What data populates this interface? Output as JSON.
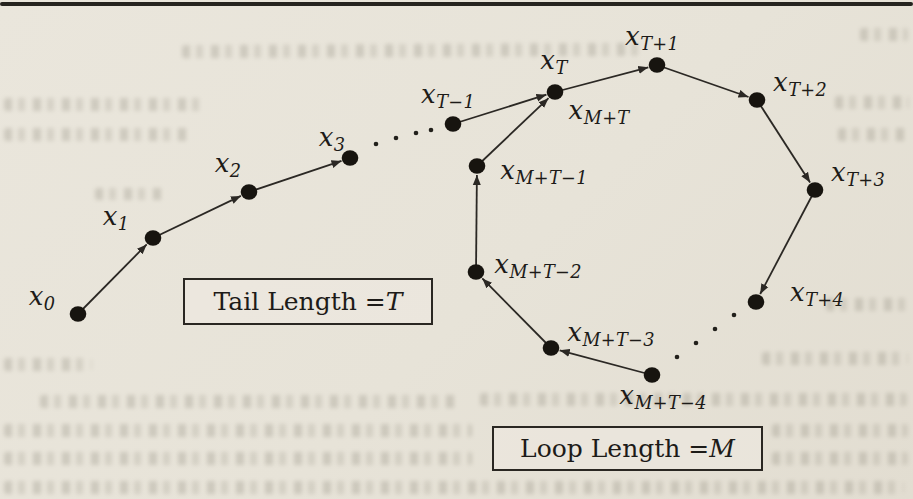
{
  "labels": {
    "x0": {
      "base": "x",
      "sub": "0"
    },
    "x1": {
      "base": "x",
      "sub": "1"
    },
    "x2": {
      "base": "x",
      "sub": "2"
    },
    "x3": {
      "base": "x",
      "sub": "3"
    },
    "xTm1": {
      "base": "x",
      "sub": "T−1"
    },
    "xT": {
      "base": "x",
      "sub": "T"
    },
    "xMpT": {
      "base": "x",
      "sub": "M+T"
    },
    "xTp1": {
      "base": "x",
      "sub": "T+1"
    },
    "xTp2": {
      "base": "x",
      "sub": "T+2"
    },
    "xTp3": {
      "base": "x",
      "sub": "T+3"
    },
    "xTp4": {
      "base": "x",
      "sub": "T+4"
    },
    "xMpTm1": {
      "base": "x",
      "sub": "M+T−1"
    },
    "xMpTm2": {
      "base": "x",
      "sub": "M+T−2"
    },
    "xMpTm3": {
      "base": "x",
      "sub": "M+T−3"
    },
    "xMpTm4": {
      "base": "x",
      "sub": "M+T−4"
    }
  },
  "boxes": {
    "tail": {
      "prefix": "Tail Length = ",
      "symbol": "T"
    },
    "loop": {
      "prefix": "Loop Length = ",
      "symbol": "M"
    }
  },
  "colors": {
    "paper": "#e8e4d9",
    "ink": "#1d1b18",
    "dot": "#17140f",
    "line": "#2b2824"
  }
}
